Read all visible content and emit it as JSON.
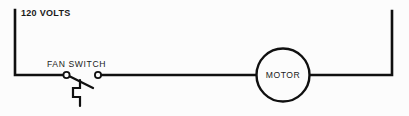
{
  "diagram": {
    "background_color": "#fcfcfc",
    "line_color": "#101010",
    "labels": {
      "supply": "120 VOLTS",
      "switch": "FAN SWITCH",
      "motor": "MOTOR"
    },
    "components": [
      {
        "name": "supply-line",
        "type": "power-source-label",
        "label": "120 VOLTS"
      },
      {
        "name": "fan-switch",
        "type": "single-pole-switch",
        "label": "FAN SWITCH",
        "state": "open"
      },
      {
        "name": "motor",
        "type": "motor",
        "label": "MOTOR",
        "symbol": "circle"
      }
    ]
  }
}
